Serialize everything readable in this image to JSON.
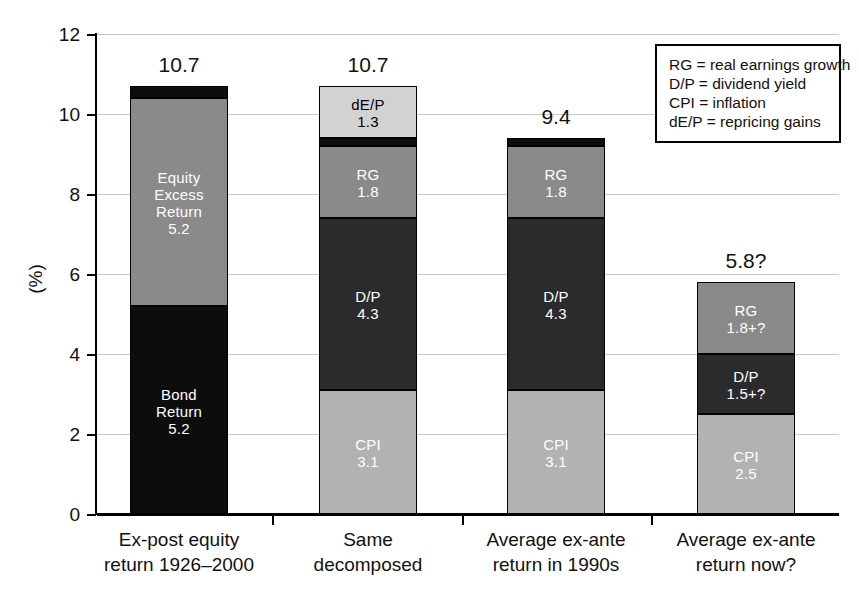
{
  "chart_data": {
    "type": "bar",
    "subtype": "stacked-bar",
    "title": "",
    "xlabel": "",
    "ylabel": "(%)",
    "ylim": [
      0,
      12
    ],
    "yticks": [
      0,
      2,
      4,
      6,
      8,
      10,
      12
    ],
    "grid": true,
    "legend_position": "top-right",
    "categories": [
      "Ex-post equity return 1926–2000",
      "Same decomposed",
      "Average ex-ante return in 1990s",
      "Average ex-ante return now?"
    ],
    "bar_totals": [
      "10.7",
      "10.7",
      "9.4",
      "5.8?"
    ],
    "bars": [
      {
        "category_lines": [
          "Ex-post equity",
          "return 1926–2000"
        ],
        "total_label": "10.7",
        "total_value": 10.7,
        "segments": [
          {
            "key": "bond-return",
            "lines": [
              "Bond",
              "Return",
              "5.2"
            ],
            "value": 5.2,
            "color": "#0d0d0d",
            "text_color": "#ffffff"
          },
          {
            "key": "equity-excess-return",
            "lines": [
              "Equity",
              "Excess",
              "Return",
              "5.2"
            ],
            "value": 5.2,
            "color": "#8a8a8a",
            "text_color": "#ffffff"
          },
          {
            "key": "cap",
            "lines": [],
            "value": 0.3,
            "color": "#0d0d0d",
            "text_color": "#ffffff"
          }
        ]
      },
      {
        "category_lines": [
          "Same",
          "decomposed"
        ],
        "total_label": "10.7",
        "total_value": 10.7,
        "segments": [
          {
            "key": "cpi",
            "lines": [
              "CPI",
              "3.1"
            ],
            "value": 3.1,
            "color": "#b2b2b2",
            "text_color": "#ffffff"
          },
          {
            "key": "dp",
            "lines": [
              "D/P",
              "4.3"
            ],
            "value": 4.3,
            "color": "#2b2b2b",
            "text_color": "#ffffff"
          },
          {
            "key": "rg",
            "lines": [
              "RG",
              "1.8"
            ],
            "value": 1.8,
            "color": "#8a8a8a",
            "text_color": "#ffffff"
          },
          {
            "key": "cap",
            "lines": [],
            "value": 0.2,
            "color": "#0d0d0d",
            "text_color": "#ffffff"
          },
          {
            "key": "dep",
            "lines": [
              "dE/P",
              "1.3"
            ],
            "value": 1.3,
            "color": "#d2d2d2",
            "text_color": "#000000"
          }
        ]
      },
      {
        "category_lines": [
          "Average ex-ante",
          "return in 1990s"
        ],
        "total_label": "9.4",
        "total_value": 9.4,
        "segments": [
          {
            "key": "cpi",
            "lines": [
              "CPI",
              "3.1"
            ],
            "value": 3.1,
            "color": "#b2b2b2",
            "text_color": "#ffffff"
          },
          {
            "key": "dp",
            "lines": [
              "D/P",
              "4.3"
            ],
            "value": 4.3,
            "color": "#2b2b2b",
            "text_color": "#ffffff"
          },
          {
            "key": "rg",
            "lines": [
              "RG",
              "1.8"
            ],
            "value": 1.8,
            "color": "#8a8a8a",
            "text_color": "#ffffff"
          },
          {
            "key": "cap",
            "lines": [],
            "value": 0.2,
            "color": "#0d0d0d",
            "text_color": "#ffffff"
          }
        ]
      },
      {
        "category_lines": [
          "Average ex-ante",
          "return now?"
        ],
        "total_label": "5.8?",
        "total_value": 5.8,
        "segments": [
          {
            "key": "cpi",
            "lines": [
              "CPI",
              "2.5"
            ],
            "value": 2.5,
            "color": "#b2b2b2",
            "text_color": "#ffffff"
          },
          {
            "key": "dp",
            "lines": [
              "D/P",
              "1.5+?"
            ],
            "value": 1.5,
            "color": "#2b2b2b",
            "text_color": "#ffffff"
          },
          {
            "key": "rg",
            "lines": [
              "RG",
              "1.8+?"
            ],
            "value": 1.8,
            "color": "#8a8a8a",
            "text_color": "#ffffff"
          }
        ]
      }
    ],
    "legend": [
      "RG = real earnings growth",
      "D/P = dividend yield",
      "CPI = inflation",
      "dE/P = repricing gains"
    ]
  },
  "colors": {
    "black": "#0d0d0d",
    "dark_gray": "#2b2b2b",
    "mid_gray": "#8a8a8a",
    "light_mid_gray": "#b2b2b2",
    "light_gray": "#d2d2d2",
    "gridline": "#c9c9c9",
    "axis": "#000000",
    "background": "#ffffff"
  }
}
